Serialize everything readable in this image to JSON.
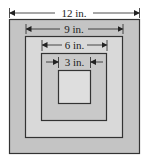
{
  "diagram": {
    "type": "nested-squares",
    "squares": [
      {
        "id": "outer",
        "label": "12 in.",
        "fill": "#c4c4c4"
      },
      {
        "id": "second",
        "label": "9 in.",
        "fill": "#d9d9d9"
      },
      {
        "id": "third",
        "label": "6 in.",
        "fill": "#c9c9c9"
      },
      {
        "id": "inner",
        "label": "3 in.",
        "fill": "#dedede"
      }
    ],
    "stroke_color": "#333333"
  }
}
